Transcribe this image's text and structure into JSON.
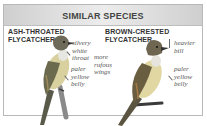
{
  "header": {
    "title": "SIMILAR SPECIES"
  },
  "species": [
    {
      "name_line1": "ASH-THROATED",
      "name_line2": "FLYCATCHER",
      "notes": [
        {
          "line1": "silvery",
          "line2": "white",
          "line3": "throat"
        },
        {
          "line1": "paler",
          "line2": "yellow",
          "line3": "belly"
        }
      ]
    },
    {
      "name_line1": "BROWN-CRESTED",
      "name_line2": "FLYCATCHER",
      "notes": [
        {
          "line1": "more",
          "line2": "rufous",
          "line3": "wings"
        },
        {
          "line1": "heavier",
          "line2": "bill",
          "line3": ""
        },
        {
          "line1": "paler",
          "line2": "yellow",
          "line3": "belly"
        }
      ]
    }
  ],
  "colors": {
    "header_bg": "#dcdcdc",
    "border": "#b8b8b8",
    "text": "#333333",
    "note_text": "#555555"
  }
}
